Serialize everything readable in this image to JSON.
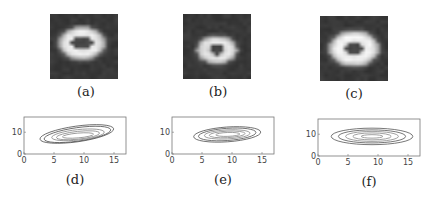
{
  "figure": {
    "panels": [
      {
        "id": "a",
        "caption": "(a)",
        "kind": "image",
        "description": "grayscale blurred ring, irregular/rectangular shape, center offset slightly up-left",
        "ring": {
          "cx": 0.47,
          "cy": 0.45,
          "rx": 0.3,
          "ry": 0.22,
          "inner_rx": 0.19,
          "inner_ry": 0.12,
          "peak": 0.92
        }
      },
      {
        "id": "b",
        "caption": "(b)",
        "kind": "image",
        "description": "grayscale blurred ring, small, centered slightly below middle",
        "ring": {
          "cx": 0.5,
          "cy": 0.55,
          "rx": 0.26,
          "ry": 0.19,
          "inner_rx": 0.11,
          "inner_ry": 0.08,
          "peak": 0.9
        }
      },
      {
        "id": "c",
        "caption": "(c)",
        "kind": "image",
        "description": "grayscale smooth ring, centered",
        "ring": {
          "cx": 0.5,
          "cy": 0.5,
          "rx": 0.32,
          "ry": 0.24,
          "inner_rx": 0.16,
          "inner_ry": 0.12,
          "peak": 0.95
        }
      }
    ]
  },
  "chart_data": [
    {
      "id": "d",
      "type": "contour",
      "caption": "(d)",
      "xlim": [
        0,
        17
      ],
      "ylim": [
        0,
        17
      ],
      "xticks": [
        "0",
        "5",
        "10",
        "15"
      ],
      "xtick_values": [
        0,
        5,
        10,
        15
      ],
      "yticks": [
        "0",
        "10"
      ],
      "ytick_values": [
        0,
        10
      ],
      "contours": [
        {
          "cx": 8.8,
          "cy": 9.2,
          "rx": 6.2,
          "ry": 3.6,
          "tilt": -8
        },
        {
          "cx": 8.9,
          "cy": 9.0,
          "rx": 5.6,
          "ry": 3.1,
          "tilt": -8
        },
        {
          "cx": 9.0,
          "cy": 8.8,
          "rx": 4.4,
          "ry": 2.4,
          "tilt": -6
        },
        {
          "cx": 9.0,
          "cy": 8.6,
          "rx": 3.6,
          "ry": 1.8,
          "tilt": -6
        },
        {
          "cx": 9.0,
          "cy": 8.5,
          "rx": 2.6,
          "ry": 1.1,
          "tilt": -5
        }
      ]
    },
    {
      "id": "e",
      "type": "contour",
      "caption": "(e)",
      "xlim": [
        0,
        17
      ],
      "ylim": [
        0,
        17
      ],
      "xticks": [
        "0",
        "5",
        "10",
        "15"
      ],
      "xtick_values": [
        0,
        5,
        10,
        15
      ],
      "yticks": [
        "0",
        "10"
      ],
      "ytick_values": [
        0,
        10
      ],
      "contours": [
        {
          "cx": 9.2,
          "cy": 9.0,
          "rx": 5.6,
          "ry": 3.4,
          "tilt": -4
        },
        {
          "cx": 9.2,
          "cy": 9.0,
          "rx": 4.8,
          "ry": 2.8,
          "tilt": -4
        },
        {
          "cx": 9.2,
          "cy": 9.0,
          "rx": 3.8,
          "ry": 2.1,
          "tilt": -3
        },
        {
          "cx": 9.2,
          "cy": 9.0,
          "rx": 3.0,
          "ry": 1.5,
          "tilt": -3
        },
        {
          "cx": 9.3,
          "cy": 9.0,
          "rx": 2.0,
          "ry": 0.9,
          "tilt": -2
        }
      ]
    },
    {
      "id": "f",
      "type": "contour",
      "caption": "(f)",
      "xlim": [
        0,
        17
      ],
      "ylim": [
        0,
        17
      ],
      "xticks": [
        "0",
        "5",
        "10",
        "15"
      ],
      "xtick_values": [
        0,
        5,
        10,
        15
      ],
      "yticks": [
        "0",
        "10"
      ],
      "ytick_values": [
        0,
        10
      ],
      "contours": [
        {
          "cx": 9.0,
          "cy": 9.0,
          "rx": 6.8,
          "ry": 3.8,
          "tilt": 0
        },
        {
          "cx": 9.0,
          "cy": 9.0,
          "rx": 5.6,
          "ry": 3.0,
          "tilt": 0
        },
        {
          "cx": 9.0,
          "cy": 9.0,
          "rx": 4.4,
          "ry": 2.3,
          "tilt": 0
        },
        {
          "cx": 9.0,
          "cy": 9.0,
          "rx": 3.2,
          "ry": 1.6,
          "tilt": 0
        },
        {
          "cx": 9.0,
          "cy": 9.0,
          "rx": 1.8,
          "ry": 0.8,
          "tilt": 0
        }
      ]
    }
  ]
}
